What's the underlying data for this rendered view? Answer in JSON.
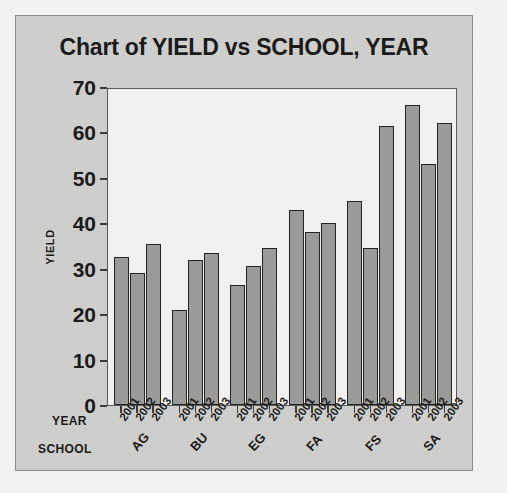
{
  "chart_data": {
    "type": "bar",
    "title": "Chart of YIELD vs SCHOOL, YEAR",
    "xlabel": "SCHOOL",
    "ylabel": "YIELD",
    "group_axis_label": "YEAR",
    "ylim": [
      0,
      70
    ],
    "yticks": [
      0,
      10,
      20,
      30,
      40,
      50,
      60,
      70
    ],
    "grid": false,
    "legend": "none",
    "categories": [
      "AG",
      "BU",
      "EG",
      "FA",
      "FS",
      "SA"
    ],
    "subcategories": [
      "2001",
      "2002",
      "2003"
    ],
    "series": [
      {
        "name": "2001",
        "values": [
          32.5,
          21.0,
          26.5,
          43.0,
          45.0,
          66.0
        ]
      },
      {
        "name": "2002",
        "values": [
          29.0,
          32.0,
          30.5,
          38.0,
          34.5,
          53.0
        ]
      },
      {
        "name": "2003",
        "values": [
          35.5,
          33.5,
          34.5,
          40.0,
          61.5,
          62.0
        ]
      }
    ],
    "colors": {
      "bar_fill": "#9b9b99",
      "bar_border": "#242422",
      "panel_background": "#cfcfcd",
      "plot_background": "#f3f2f0",
      "text": "#1b1b1b"
    }
  }
}
